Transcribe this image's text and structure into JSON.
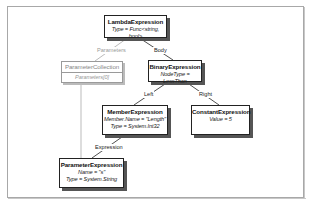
{
  "nodes": {
    "lambda": {
      "title": "LambdaExpression",
      "props": [
        "Type = Func<string, bool>"
      ]
    },
    "param_collection": {
      "title": "ParameterCollection",
      "props": [
        "Parameters[0]"
      ]
    },
    "binary": {
      "title": "BinaryExpression",
      "props": [
        "NodeType = LessThan"
      ]
    },
    "member": {
      "title": "MemberExpression",
      "props": [
        "Member.Name = \"Length\"",
        "Type = System.Int32"
      ]
    },
    "constant": {
      "title": "ConstantExpression",
      "props": [
        "Value = 5"
      ]
    },
    "parameter": {
      "title": "ParameterExpression",
      "props": [
        "Name = \"s\"",
        "Type = System.String"
      ]
    }
  },
  "edges": {
    "parameters": "Parameters",
    "body": "Body",
    "left": "Left",
    "right": "Right",
    "expression": "Expression"
  },
  "colors": {
    "edge": "#222222",
    "edge_dim": "#aaaaaa",
    "frame": "#a8a8a8"
  }
}
